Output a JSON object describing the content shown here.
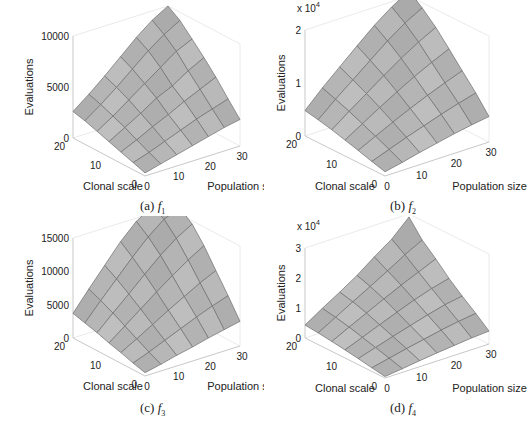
{
  "figure": {
    "background": "#ffffff",
    "surface_fill": "#b8b8b8",
    "surface_edge": "#6e6e6e",
    "axis_color": "#c8c8c8"
  },
  "chart_data": [
    {
      "type": "surface3d",
      "panel": "a",
      "caption_prefix": "(a)",
      "caption_func": "f",
      "caption_sub": "1",
      "xlabel": "Population size",
      "ylabel": "Clonal scale",
      "zlabel": "Evaluations",
      "z_multiplier_label": "",
      "x_ticks": [
        "0",
        "10",
        "20",
        "30"
      ],
      "y_ticks": [
        "0",
        "10",
        "20"
      ],
      "z_ticks": [
        "0",
        "5000",
        "10000"
      ],
      "xlim": [
        0,
        30
      ],
      "ylim": [
        0,
        20
      ],
      "zlim": [
        0,
        10000
      ],
      "x": [
        0,
        5,
        10,
        15,
        20,
        25,
        30
      ],
      "y": [
        0,
        3.3,
        6.7,
        10,
        13.3,
        16.7,
        20
      ],
      "z": [
        [
          300,
          700,
          1100,
          1500,
          1900,
          2300,
          2600
        ],
        [
          700,
          1200,
          1800,
          2400,
          3000,
          3500,
          4000
        ],
        [
          1100,
          1800,
          2600,
          3300,
          4100,
          4800,
          5500
        ],
        [
          1500,
          2400,
          3300,
          4300,
          5000,
          6000,
          6800
        ],
        [
          1900,
          2900,
          4000,
          5100,
          6200,
          7300,
          8000
        ],
        [
          2300,
          3400,
          4600,
          5900,
          7200,
          8300,
          9200
        ],
        [
          2600,
          3800,
          5100,
          6500,
          7900,
          9100,
          10000
        ]
      ]
    },
    {
      "type": "surface3d",
      "panel": "b",
      "caption_prefix": "(b)",
      "caption_func": "f",
      "caption_sub": "2",
      "xlabel": "Population size",
      "ylabel": "Clonal scale",
      "zlabel": "Evaluations",
      "z_multiplier_label": "x 10^4",
      "x_ticks": [
        "0",
        "10",
        "20",
        "30"
      ],
      "y_ticks": [
        "0",
        "10",
        "20"
      ],
      "z_ticks": [
        "0",
        "1",
        "2"
      ],
      "xlim": [
        0,
        30
      ],
      "ylim": [
        0,
        20
      ],
      "zlim": [
        0,
        20000
      ],
      "x": [
        0,
        5,
        10,
        15,
        20,
        25,
        30
      ],
      "y": [
        0,
        3.3,
        6.7,
        10,
        13.3,
        16.7,
        20
      ],
      "z": [
        [
          800,
          1500,
          2300,
          3000,
          3700,
          4300,
          4800
        ],
        [
          1500,
          2700,
          3900,
          5000,
          6100,
          7100,
          8000
        ],
        [
          2300,
          3900,
          5500,
          7000,
          8400,
          9700,
          10900
        ],
        [
          3000,
          5000,
          7000,
          8900,
          10700,
          12300,
          13800
        ],
        [
          3700,
          6100,
          8400,
          10700,
          12900,
          14900,
          16600
        ],
        [
          4300,
          7100,
          9700,
          12300,
          14900,
          17200,
          19000
        ],
        [
          4800,
          8000,
          10900,
          13800,
          16600,
          19000,
          21000
        ]
      ]
    },
    {
      "type": "surface3d",
      "panel": "c",
      "caption_prefix": "(c)",
      "caption_func": "f",
      "caption_sub": "3",
      "xlabel": "Population size",
      "ylabel": "Clonal scale",
      "zlabel": "Evaluations",
      "z_multiplier_label": "",
      "x_ticks": [
        "0",
        "10",
        "20",
        "30"
      ],
      "y_ticks": [
        "0",
        "10",
        "20"
      ],
      "z_ticks": [
        "0",
        "5000",
        "10000",
        "15000"
      ],
      "xlim": [
        0,
        30
      ],
      "ylim": [
        0,
        20
      ],
      "zlim": [
        0,
        15000
      ],
      "x": [
        0,
        5,
        10,
        15,
        20,
        25,
        30
      ],
      "y": [
        0,
        3.3,
        6.7,
        10,
        13.3,
        16.7,
        20
      ],
      "z": [
        [
          500,
          1000,
          1600,
          2100,
          2700,
          3200,
          3700
        ],
        [
          1000,
          1900,
          2900,
          3900,
          4900,
          5800,
          6600
        ],
        [
          1600,
          2900,
          4300,
          5700,
          7000,
          8300,
          9400
        ],
        [
          2100,
          3900,
          5700,
          7500,
          9200,
          10800,
          12200
        ],
        [
          2700,
          4900,
          7000,
          9200,
          11300,
          13100,
          14500
        ],
        [
          3200,
          5800,
          8300,
          10800,
          13100,
          15000,
          16000
        ],
        [
          3700,
          6600,
          9400,
          12200,
          14500,
          16000,
          17000
        ]
      ]
    },
    {
      "type": "surface3d",
      "panel": "d",
      "caption_prefix": "(d)",
      "caption_func": "f",
      "caption_sub": "4",
      "xlabel": "Population size",
      "ylabel": "Clonal scale",
      "zlabel": "Evaluations",
      "z_multiplier_label": "x 10^4",
      "x_ticks": [
        "0",
        "10",
        "20",
        "30"
      ],
      "y_ticks": [
        "0",
        "10",
        "20"
      ],
      "z_ticks": [
        "0",
        "1",
        "2",
        "3"
      ],
      "xlim": [
        0,
        30
      ],
      "ylim": [
        0,
        20
      ],
      "zlim": [
        0,
        30000
      ],
      "x": [
        0,
        5,
        10,
        15,
        20,
        25,
        30
      ],
      "y": [
        0,
        3.3,
        6.7,
        10,
        13.3,
        16.7,
        20
      ],
      "z": [
        [
          500,
          1200,
          2000,
          2700,
          3300,
          3900,
          4300
        ],
        [
          1200,
          2500,
          3800,
          5000,
          6200,
          7200,
          8000
        ],
        [
          2000,
          3800,
          5600,
          7300,
          9000,
          10500,
          11500
        ],
        [
          2700,
          5000,
          7300,
          9600,
          11800,
          13700,
          15200
        ],
        [
          3300,
          6200,
          9000,
          11800,
          14500,
          17000,
          19500
        ],
        [
          3900,
          7200,
          10500,
          13700,
          17000,
          20500,
          23500
        ],
        [
          4300,
          8000,
          11500,
          15200,
          19500,
          23500,
          29000
        ]
      ]
    }
  ]
}
